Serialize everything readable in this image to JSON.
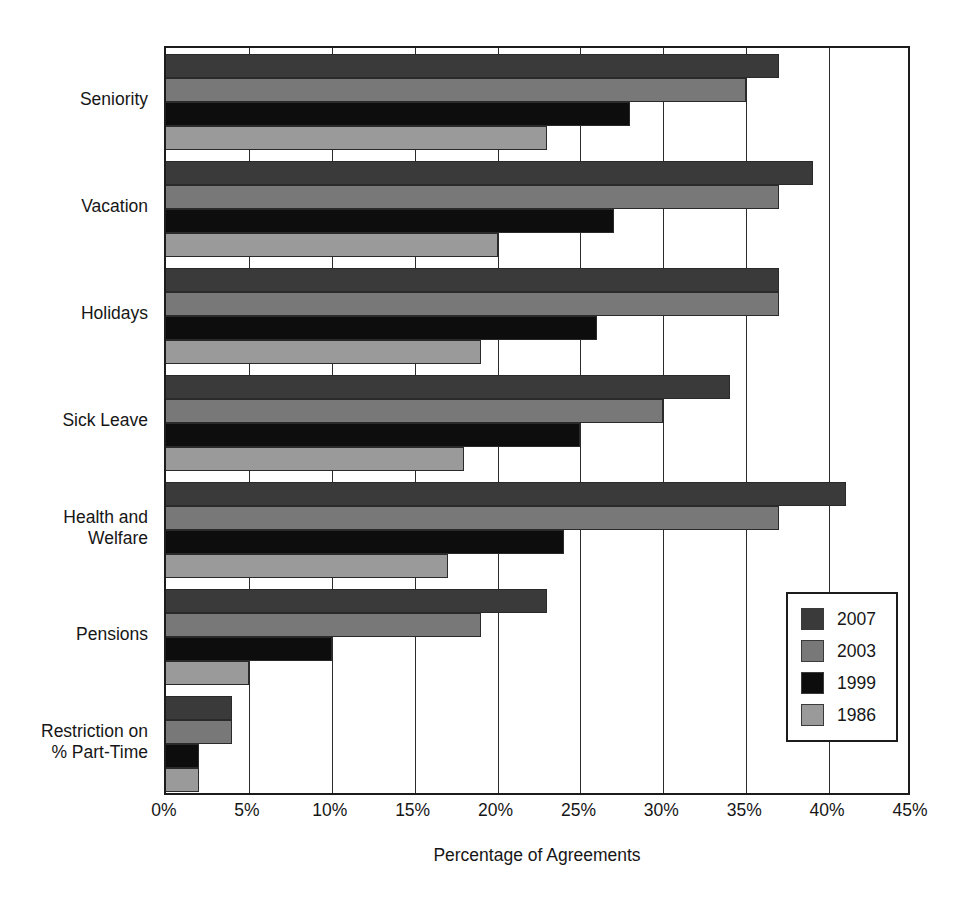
{
  "chart_data": {
    "type": "bar",
    "orientation": "horizontal",
    "title": "",
    "xlabel": "Percentage of Agreements",
    "ylabel": "",
    "xlim": [
      0,
      45
    ],
    "xticks": [
      0,
      5,
      10,
      15,
      20,
      25,
      30,
      35,
      40,
      45
    ],
    "xtick_labels": [
      "0%",
      "5%",
      "10%",
      "15%",
      "20%",
      "25%",
      "30%",
      "35%",
      "40%",
      "45%"
    ],
    "grid": true,
    "legend_position": "bottom-right",
    "categories": [
      "Seniority",
      "Vacation",
      "Holidays",
      "Sick Leave",
      "Health and\nWelfare",
      "Pensions",
      "Restriction on\n% Part-Time"
    ],
    "series": [
      {
        "name": "2007",
        "color": "#3a3a3a",
        "values": [
          37,
          39,
          37,
          34,
          41,
          23,
          4
        ]
      },
      {
        "name": "2003",
        "color": "#787878",
        "values": [
          35,
          37,
          37,
          30,
          37,
          19,
          4
        ]
      },
      {
        "name": "1999",
        "color": "#0d0d0d",
        "values": [
          28,
          27,
          26,
          25,
          24,
          10,
          2
        ]
      },
      {
        "name": "1986",
        "color": "#9a9a9a",
        "values": [
          23,
          20,
          19,
          18,
          17,
          5,
          2
        ]
      }
    ]
  },
  "legend": {
    "items": [
      {
        "label": "2007",
        "color": "#3a3a3a"
      },
      {
        "label": "2003",
        "color": "#787878"
      },
      {
        "label": "1999",
        "color": "#0d0d0d"
      },
      {
        "label": "1986",
        "color": "#9a9a9a"
      }
    ]
  }
}
